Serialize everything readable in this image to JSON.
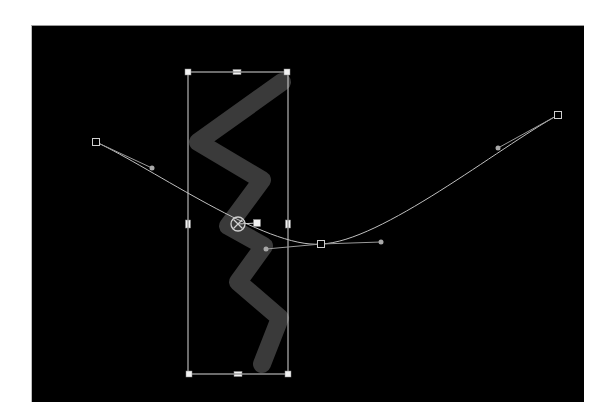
{
  "canvas": {
    "background": "#000000",
    "x": 31,
    "y": 25,
    "width": 552,
    "height": 376
  },
  "brush_stroke": {
    "color": "#3a3a3a",
    "width": 18,
    "points": [
      [
        282,
        82
      ],
      [
        198,
        142
      ],
      [
        262,
        180
      ],
      [
        228,
        226
      ],
      [
        264,
        246
      ],
      [
        238,
        282
      ],
      [
        280,
        318
      ],
      [
        262,
        364
      ]
    ]
  },
  "bounding_box": {
    "color": "#d8d8d8",
    "x1": 188,
    "y1": 72,
    "x2": 288,
    "y2": 374,
    "handles": [
      {
        "name": "top-left",
        "x": 188,
        "y": 72
      },
      {
        "name": "top-center",
        "x": 237,
        "y": 72
      },
      {
        "name": "top-right",
        "x": 287,
        "y": 72
      },
      {
        "name": "middle-left",
        "x": 188,
        "y": 224
      },
      {
        "name": "middle-right",
        "x": 288,
        "y": 224
      },
      {
        "name": "bottom-left",
        "x": 189,
        "y": 374
      },
      {
        "name": "bottom-center",
        "x": 238,
        "y": 374
      },
      {
        "name": "bottom-right",
        "x": 288,
        "y": 374
      }
    ]
  },
  "anchor_point": {
    "x": 238,
    "y": 224,
    "handle": {
      "x": 257,
      "y": 223
    }
  },
  "motion_path": {
    "color": "#bfbfbf",
    "keyframes": [
      {
        "x": 96,
        "y": 142,
        "out_handle": {
          "x": 152,
          "y": 168
        }
      },
      {
        "x": 321,
        "y": 244,
        "in_handle": {
          "x": 266,
          "y": 249
        },
        "out_handle": {
          "x": 381,
          "y": 242
        }
      },
      {
        "x": 558,
        "y": 115,
        "in_handle": {
          "x": 498,
          "y": 148
        }
      }
    ]
  }
}
